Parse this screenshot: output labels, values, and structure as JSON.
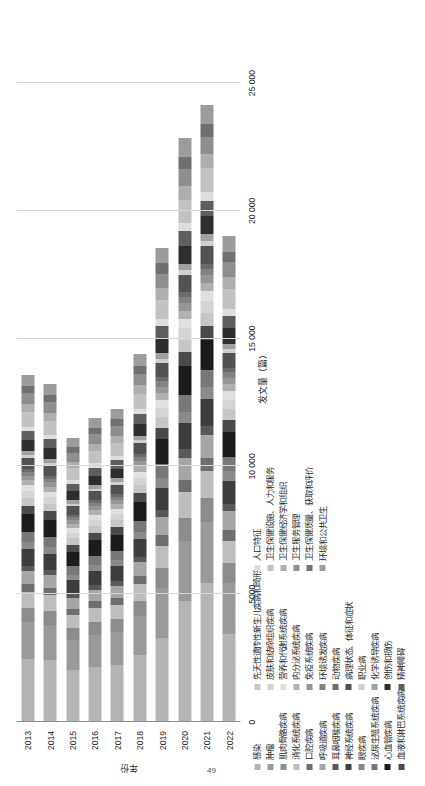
{
  "figure": {
    "page_number": "49",
    "axes": {
      "value_axis_title": "发文量（篇）",
      "category_axis_title": "年份",
      "value_ticks": [
        "0",
        "5000",
        "10 000",
        "15 000",
        "20 000",
        "25 000"
      ],
      "value_tick_numbers": [
        0,
        5000,
        10000,
        15000,
        20000,
        25000
      ],
      "value_min": 0,
      "value_max": 27000,
      "grid": true,
      "legend_position": "right-rotated"
    }
  },
  "chart_data": {
    "type": "bar",
    "orientation": "horizontal-stacked",
    "title": "",
    "xlabel": "年份",
    "ylabel": "发文量（篇）",
    "ylim": [
      0,
      27000
    ],
    "categories": [
      "2013",
      "2014",
      "2015",
      "2016",
      "2017",
      "2018",
      "2019",
      "2020",
      "2021",
      "2022"
    ],
    "totals": [
      13200,
      13050,
      10900,
      11700,
      11900,
      14200,
      18100,
      22600,
      23700,
      18500
    ],
    "series": [
      {
        "name": "感染",
        "color": "#b4b4b4",
        "values": [
          2480,
          2430,
          2050,
          2160,
          2230,
          2620,
          3280,
          4720,
          5420,
          3430
        ]
      },
      {
        "name": "肿瘤",
        "color": "#9a9a9a",
        "values": [
          1420,
          1380,
          1170,
          1260,
          1290,
          1520,
          1980,
          2350,
          2420,
          2000
        ]
      },
      {
        "name": "肌肉骨骼疾病",
        "color": "#8c8c8c",
        "values": [
          560,
          540,
          450,
          480,
          500,
          580,
          760,
          900,
          930,
          780
        ]
      },
      {
        "name": "消化系统疾病",
        "color": "#bdbdbd",
        "values": [
          640,
          620,
          520,
          560,
          570,
          670,
          870,
          1030,
          1070,
          890
        ]
      },
      {
        "name": "口腔疾病",
        "color": "#6e6e6e",
        "values": [
          300,
          290,
          245,
          263,
          270,
          318,
          410,
          487,
          505,
          420
        ]
      },
      {
        "name": "呼吸道疾病",
        "color": "#a6a6a6",
        "values": [
          520,
          505,
          425,
          456,
          468,
          552,
          714,
          847,
          876,
          730
        ]
      },
      {
        "name": "耳鼻咽喉疾病",
        "color": "#595959",
        "values": [
          205,
          199,
          167,
          180,
          184,
          217,
          281,
          333,
          345,
          288
        ]
      },
      {
        "name": "神经系统疾病",
        "color": "#3d3d3d",
        "values": [
          640,
          622,
          523,
          561,
          576,
          679,
          878,
          1042,
          1078,
          898
        ]
      },
      {
        "name": "眼疾病",
        "color": "#8a8a8a",
        "values": [
          265,
          258,
          217,
          232,
          239,
          281,
          364,
          432,
          447,
          372
        ]
      },
      {
        "name": "泌尿生殖系统疾病",
        "color": "#787878",
        "values": [
          410,
          398,
          335,
          359,
          369,
          434,
          562,
          667,
          690,
          575
        ]
      },
      {
        "name": "心血管疾病",
        "color": "#1c1c1c",
        "values": [
          700,
          680,
          572,
          613,
          630,
          742,
          960,
          1139,
          1179,
          982
        ]
      },
      {
        "name": "血液和淋巴系统疾病",
        "color": "#4a4a4a",
        "values": [
          330,
          320,
          269,
          289,
          297,
          349,
          452,
          536,
          555,
          462
        ]
      },
      {
        "name": "先天性遗传性新生儿疾病和畸形",
        "color": "#c6c6c6",
        "values": [
          300,
          291,
          245,
          263,
          270,
          318,
          411,
          488,
          505,
          420
        ]
      },
      {
        "name": "皮肤和结缔组织疾病",
        "color": "#d4d4d4",
        "values": [
          265,
          258,
          217,
          232,
          239,
          281,
          364,
          432,
          447,
          372
        ]
      },
      {
        "name": "营养和代谢系统疾病",
        "color": "#e0e0e0",
        "values": [
          230,
          224,
          188,
          202,
          207,
          244,
          316,
          375,
          388,
          323
        ]
      },
      {
        "name": "内分泌系统疾病",
        "color": "#b0b0b0",
        "values": [
          200,
          194,
          163,
          175,
          180,
          212,
          274,
          325,
          337,
          280
        ]
      },
      {
        "name": "免疫系统疾病",
        "color": "#969696",
        "values": [
          185,
          180,
          151,
          162,
          167,
          196,
          254,
          302,
          312,
          260
        ]
      },
      {
        "name": "环境诱发疾病",
        "color": "#828282",
        "values": [
          145,
          141,
          119,
          127,
          131,
          154,
          199,
          236,
          245,
          204
        ]
      },
      {
        "name": "动物疾病",
        "color": "#6a6a6a",
        "values": [
          115,
          112,
          94,
          101,
          104,
          122,
          158,
          188,
          194,
          162
        ]
      },
      {
        "name": "病理状态、体征和症状",
        "color": "#525252",
        "values": [
          420,
          408,
          343,
          368,
          378,
          445,
          576,
          684,
          707,
          589
        ]
      },
      {
        "name": "职业病",
        "color": "#cfcfcf",
        "values": [
          105,
          102,
          86,
          92,
          95,
          111,
          144,
          171,
          177,
          147
        ]
      },
      {
        "name": "化学诱导疾病",
        "color": "#a0a0a0",
        "values": [
          160,
          155,
          131,
          140,
          144,
          170,
          220,
          261,
          270,
          225
        ]
      },
      {
        "name": "创伤和损伤",
        "color": "#2e2e2e",
        "values": [
          430,
          418,
          351,
          377,
          387,
          456,
          590,
          700,
          724,
          603
        ]
      },
      {
        "name": "精神障碍",
        "color": "#5e5e5e",
        "values": [
          350,
          340,
          286,
          307,
          315,
          371,
          480,
          570,
          589,
          491
        ]
      },
      {
        "name": "人口特征",
        "color": "#dedede",
        "values": [
          190,
          185,
          155,
          167,
          171,
          202,
          261,
          310,
          320,
          267
        ]
      },
      {
        "name": "卫生保健设施、人力和服务",
        "color": "#c2c2c2",
        "values": [
          560,
          544,
          457,
          490,
          504,
          593,
          767,
          911,
          942,
          785
        ]
      },
      {
        "name": "卫生保健经济学和组织",
        "color": "#aeaeae",
        "values": [
          330,
          320,
          269,
          289,
          297,
          349,
          452,
          536,
          555,
          462
        ]
      },
      {
        "name": "卫生服务管理",
        "color": "#8e8e8e",
        "values": [
          410,
          398,
          335,
          359,
          369,
          434,
          562,
          667,
          690,
          575
        ]
      },
      {
        "name": "卫生保健质量、获取和评价",
        "color": "#707070",
        "values": [
          300,
          291,
          245,
          263,
          270,
          318,
          411,
          488,
          505,
          420
        ]
      },
      {
        "name": "环境和公共卫生",
        "color": "#9c9c9c",
        "values": [
          440,
          427,
          359,
          385,
          396,
          466,
          603,
          716,
          741,
          617
        ]
      }
    ]
  }
}
